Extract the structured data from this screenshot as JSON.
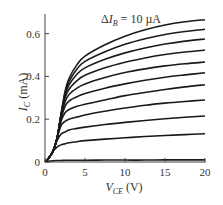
{
  "chart_data": {
    "type": "line",
    "title": "",
    "annotation": "ΔI_B = 10 µA",
    "xlabel": "V_CE (V)",
    "ylabel": "I_C (mA)",
    "xlim": [
      0,
      20
    ],
    "ylim": [
      0,
      0.7
    ],
    "xticks": [
      "0",
      "5",
      "10",
      "15",
      "20"
    ],
    "yticks": [
      "0",
      "0.2",
      "0.4",
      "0.6"
    ],
    "grid": false,
    "legend": "none",
    "x": [
      0,
      0.5,
      1,
      1.5,
      2,
      2.5,
      3,
      4,
      5,
      7.5,
      10,
      12.5,
      15,
      17.5,
      20
    ],
    "series": [
      {
        "name": "I_B step 0",
        "values": [
          0,
          0.004,
          0.006,
          0.007,
          0.007,
          0.008,
          0.008,
          0.008,
          0.008,
          0.009,
          0.009,
          0.009,
          0.01,
          0.01,
          0.01
        ]
      },
      {
        "name": "I_B step 1",
        "values": [
          0,
          0.02,
          0.05,
          0.07,
          0.08,
          0.085,
          0.09,
          0.095,
          0.1,
          0.107,
          0.113,
          0.119,
          0.124,
          0.128,
          0.132
        ]
      },
      {
        "name": "I_B step 2",
        "values": [
          0,
          0.02,
          0.05,
          0.1,
          0.13,
          0.14,
          0.15,
          0.157,
          0.163,
          0.175,
          0.185,
          0.194,
          0.202,
          0.209,
          0.215
        ]
      },
      {
        "name": "I_B step 3",
        "values": [
          0,
          0.02,
          0.05,
          0.11,
          0.17,
          0.19,
          0.2,
          0.21,
          0.22,
          0.237,
          0.252,
          0.265,
          0.275,
          0.283,
          0.29
        ]
      },
      {
        "name": "I_B step 4",
        "values": [
          0,
          0.02,
          0.05,
          0.11,
          0.19,
          0.23,
          0.245,
          0.26,
          0.27,
          0.29,
          0.31,
          0.325,
          0.339,
          0.351,
          0.361
        ]
      },
      {
        "name": "I_B step 5",
        "values": [
          0,
          0.02,
          0.05,
          0.11,
          0.2,
          0.26,
          0.285,
          0.305,
          0.32,
          0.345,
          0.365,
          0.382,
          0.396,
          0.407,
          0.417
        ]
      },
      {
        "name": "I_B step 6",
        "values": [
          0,
          0.02,
          0.05,
          0.11,
          0.21,
          0.28,
          0.315,
          0.345,
          0.365,
          0.395,
          0.418,
          0.435,
          0.449,
          0.459,
          0.467
        ]
      },
      {
        "name": "I_B step 7",
        "values": [
          0,
          0.02,
          0.05,
          0.11,
          0.22,
          0.3,
          0.34,
          0.38,
          0.405,
          0.44,
          0.466,
          0.486,
          0.502,
          0.514,
          0.523
        ]
      },
      {
        "name": "I_B step 8",
        "values": [
          0,
          0.02,
          0.05,
          0.11,
          0.22,
          0.31,
          0.36,
          0.41,
          0.44,
          0.48,
          0.51,
          0.533,
          0.551,
          0.565,
          0.575
        ]
      },
      {
        "name": "I_B step 9",
        "values": [
          0,
          0.02,
          0.05,
          0.11,
          0.22,
          0.32,
          0.375,
          0.435,
          0.47,
          0.515,
          0.55,
          0.576,
          0.596,
          0.61,
          0.62
        ]
      },
      {
        "name": "I_B step 10",
        "values": [
          0,
          0.02,
          0.05,
          0.11,
          0.22,
          0.33,
          0.39,
          0.455,
          0.495,
          0.548,
          0.588,
          0.618,
          0.64,
          0.655,
          0.665
        ]
      }
    ]
  }
}
